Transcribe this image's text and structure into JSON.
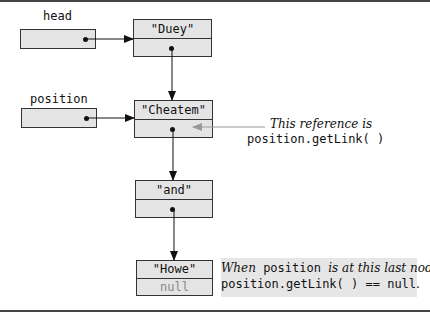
{
  "diagram": {
    "pointers": [
      {
        "name": "head",
        "label": "head"
      },
      {
        "name": "position",
        "label": "position"
      }
    ],
    "nodes": [
      {
        "data": "\"Duey\"",
        "link": ""
      },
      {
        "data": "\"Cheatem\"",
        "link": ""
      },
      {
        "data": "\"and\"",
        "link": ""
      },
      {
        "data": "\"Howe\"",
        "link": "null"
      }
    ],
    "annotation_reference": {
      "line1": "This reference is",
      "line2": "position.getLink( )"
    },
    "annotation_last_node": {
      "line1_italic_a": "When",
      "line1_mono": "position",
      "line1_italic_b": "is at this last node,",
      "line2_mono": "position.getLink( ) == null",
      "line2_end": "."
    },
    "colors": {
      "box_fill": "#e4e4e4",
      "stroke": "#333333",
      "reference_arrow": "#999999",
      "note_fill": "#e6e6e6",
      "null_text": "#888888"
    }
  }
}
